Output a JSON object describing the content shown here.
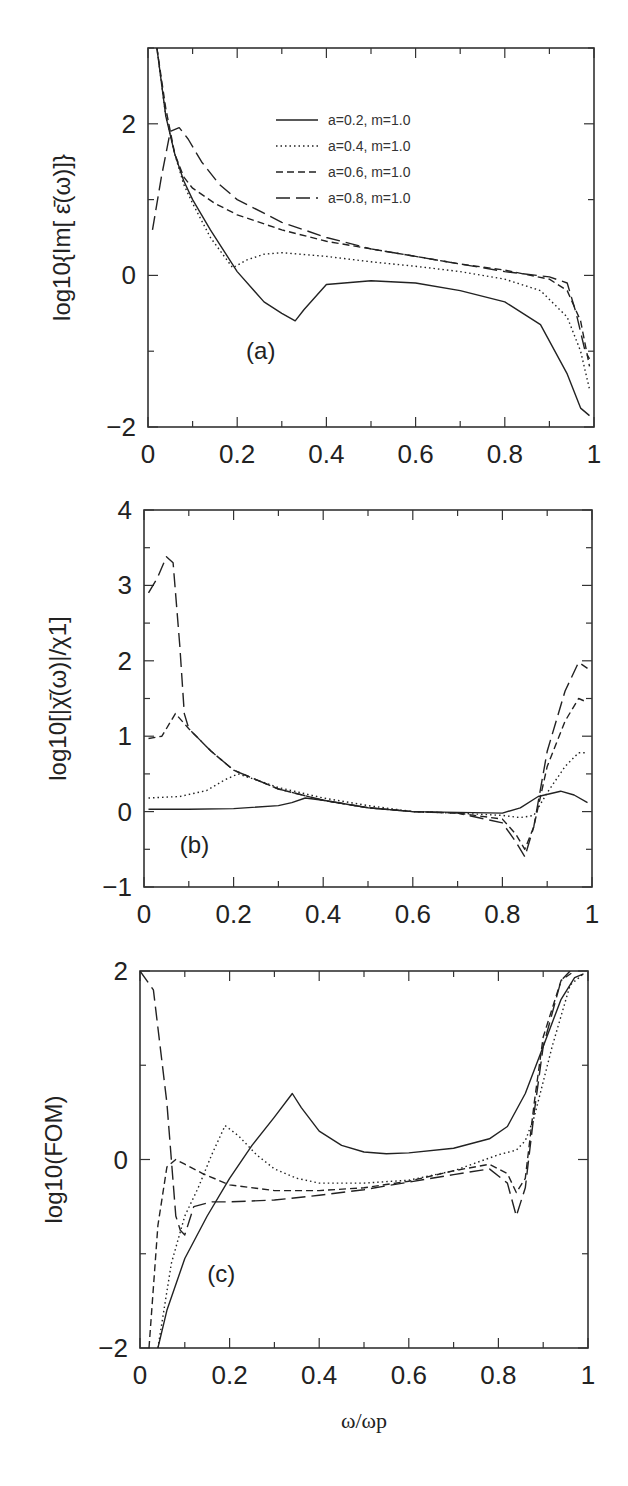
{
  "chart_data": [
    {
      "type": "line",
      "panel": "(a)",
      "ylabel": "log10{Im[ ε̄(ω)]}",
      "xlabel": "",
      "xlim": [
        0,
        1
      ],
      "ylim": [
        -2,
        3
      ],
      "xticks": [
        "0",
        "0.2",
        "0.4",
        "0.6",
        "0.8",
        "1"
      ],
      "yticks": [
        "-2",
        "0",
        "2"
      ],
      "legend_placement": "top-right",
      "series": [
        {
          "name": "a=0.2, m=1.0",
          "style": "solid",
          "x": [
            0.02,
            0.04,
            0.06,
            0.08,
            0.1,
            0.14,
            0.2,
            0.26,
            0.3,
            0.33,
            0.35,
            0.4,
            0.5,
            0.6,
            0.7,
            0.8,
            0.88,
            0.94,
            0.97,
            0.99
          ],
          "y": [
            3.0,
            2.1,
            1.6,
            1.25,
            1.0,
            0.6,
            0.05,
            -0.35,
            -0.5,
            -0.6,
            -0.45,
            -0.12,
            -0.07,
            -0.1,
            -0.2,
            -0.35,
            -0.65,
            -1.3,
            -1.75,
            -1.85
          ]
        },
        {
          "name": "a=0.4, m=1.0",
          "style": "dotted",
          "x": [
            0.02,
            0.04,
            0.06,
            0.08,
            0.1,
            0.14,
            0.19,
            0.22,
            0.26,
            0.3,
            0.4,
            0.5,
            0.6,
            0.7,
            0.8,
            0.88,
            0.94,
            0.97,
            0.99
          ],
          "y": [
            3.0,
            2.1,
            1.6,
            1.2,
            0.95,
            0.5,
            0.1,
            0.2,
            0.28,
            0.3,
            0.25,
            0.18,
            0.12,
            0.05,
            -0.05,
            -0.2,
            -0.55,
            -1.0,
            -1.5
          ]
        },
        {
          "name": "a=0.6, m=1.0",
          "style": "dashed",
          "x": [
            0.02,
            0.04,
            0.06,
            0.08,
            0.1,
            0.15,
            0.2,
            0.3,
            0.4,
            0.5,
            0.6,
            0.7,
            0.8,
            0.9,
            0.94,
            0.97,
            0.99
          ],
          "y": [
            3.0,
            2.2,
            1.6,
            1.3,
            1.15,
            0.95,
            0.8,
            0.6,
            0.45,
            0.35,
            0.25,
            0.15,
            0.07,
            -0.05,
            -0.2,
            -0.6,
            -1.2
          ]
        },
        {
          "name": "a=0.8, m=1.0",
          "style": "long-dashed",
          "x": [
            0.01,
            0.03,
            0.05,
            0.07,
            0.09,
            0.12,
            0.16,
            0.2,
            0.3,
            0.4,
            0.5,
            0.6,
            0.7,
            0.8,
            0.9,
            0.94,
            0.96,
            0.98,
            0.99
          ],
          "y": [
            0.6,
            1.3,
            1.9,
            1.95,
            1.8,
            1.5,
            1.2,
            1.0,
            0.7,
            0.5,
            0.35,
            0.25,
            0.15,
            0.05,
            -0.02,
            -0.1,
            -0.5,
            -1.0,
            -1.1
          ]
        }
      ]
    },
    {
      "type": "line",
      "panel": "(b)",
      "ylabel": "log10[|χ̄(ω)|/χ1]",
      "xlabel": "",
      "xlim": [
        0,
        1
      ],
      "ylim": [
        -1,
        4
      ],
      "xticks": [
        "0",
        "0.2",
        "0.4",
        "0.6",
        "0.8",
        "1"
      ],
      "yticks": [
        "-1",
        "0",
        "1",
        "2",
        "3",
        "4"
      ],
      "series": [
        {
          "name": "a=0.2, m=1.0",
          "style": "solid",
          "x": [
            0.01,
            0.1,
            0.2,
            0.3,
            0.33,
            0.36,
            0.4,
            0.5,
            0.6,
            0.7,
            0.8,
            0.84,
            0.88,
            0.93,
            0.96,
            0.99
          ],
          "y": [
            0.03,
            0.03,
            0.04,
            0.08,
            0.12,
            0.18,
            0.15,
            0.05,
            0.0,
            -0.01,
            -0.02,
            0.05,
            0.2,
            0.27,
            0.22,
            0.12
          ]
        },
        {
          "name": "a=0.4, m=1.0",
          "style": "dotted",
          "x": [
            0.01,
            0.08,
            0.14,
            0.18,
            0.21,
            0.25,
            0.3,
            0.4,
            0.5,
            0.6,
            0.7,
            0.8,
            0.84,
            0.87,
            0.9,
            0.94,
            0.97,
            0.99
          ],
          "y": [
            0.18,
            0.2,
            0.28,
            0.42,
            0.5,
            0.42,
            0.32,
            0.18,
            0.08,
            0.0,
            -0.02,
            -0.05,
            -0.08,
            -0.05,
            0.25,
            0.6,
            0.78,
            0.78
          ]
        },
        {
          "name": "a=0.6, m=1.0",
          "style": "dashed",
          "x": [
            0.01,
            0.04,
            0.07,
            0.1,
            0.15,
            0.2,
            0.3,
            0.4,
            0.5,
            0.6,
            0.7,
            0.8,
            0.83,
            0.85,
            0.87,
            0.9,
            0.94,
            0.97,
            0.99
          ],
          "y": [
            0.97,
            1.0,
            1.3,
            1.1,
            0.8,
            0.55,
            0.3,
            0.15,
            0.05,
            0.0,
            -0.02,
            -0.1,
            -0.3,
            -0.5,
            -0.2,
            0.6,
            1.2,
            1.5,
            1.45
          ]
        },
        {
          "name": "a=0.8, m=1.0",
          "style": "long-dashed",
          "x": [
            0.01,
            0.03,
            0.05,
            0.065,
            0.08,
            0.09,
            0.1,
            0.15,
            0.2,
            0.3,
            0.4,
            0.5,
            0.6,
            0.7,
            0.8,
            0.83,
            0.85,
            0.87,
            0.9,
            0.94,
            0.97,
            0.99
          ],
          "y": [
            2.9,
            3.1,
            3.38,
            3.3,
            2.2,
            1.3,
            1.1,
            0.8,
            0.55,
            0.3,
            0.15,
            0.05,
            0.0,
            -0.02,
            -0.15,
            -0.4,
            -0.6,
            -0.2,
            0.8,
            1.6,
            1.98,
            1.9
          ]
        }
      ]
    },
    {
      "type": "line",
      "panel": "(c)",
      "ylabel": "log10(FOM)",
      "xlabel": "ω/ωp",
      "xlim": [
        0,
        1
      ],
      "ylim": [
        -2,
        2
      ],
      "xticks": [
        "0",
        "0.2",
        "0.4",
        "0.6",
        "0.8",
        "1"
      ],
      "yticks": [
        "-2",
        "0",
        "2"
      ],
      "series": [
        {
          "name": "a=0.2, m=1.0",
          "style": "solid",
          "x": [
            0.04,
            0.06,
            0.1,
            0.15,
            0.2,
            0.25,
            0.3,
            0.34,
            0.36,
            0.4,
            0.45,
            0.5,
            0.55,
            0.6,
            0.7,
            0.78,
            0.82,
            0.86,
            0.9,
            0.94,
            0.97,
            0.99
          ],
          "y": [
            -2.0,
            -1.6,
            -1.05,
            -0.6,
            -0.2,
            0.15,
            0.45,
            0.7,
            0.55,
            0.3,
            0.15,
            0.08,
            0.06,
            0.07,
            0.12,
            0.22,
            0.35,
            0.7,
            1.2,
            1.7,
            1.93,
            1.97
          ]
        },
        {
          "name": "a=0.4, m=1.0",
          "style": "dotted",
          "x": [
            0.04,
            0.07,
            0.1,
            0.13,
            0.16,
            0.19,
            0.22,
            0.26,
            0.3,
            0.35,
            0.4,
            0.5,
            0.6,
            0.7,
            0.8,
            0.84,
            0.86,
            0.88,
            0.92,
            0.96,
            0.99
          ],
          "y": [
            -2.0,
            -1.1,
            -0.6,
            -0.3,
            0.05,
            0.36,
            0.25,
            0.05,
            -0.1,
            -0.2,
            -0.25,
            -0.25,
            -0.22,
            -0.12,
            0.05,
            0.1,
            0.2,
            0.45,
            1.2,
            1.85,
            1.97
          ]
        },
        {
          "name": "a=0.6, m=1.0",
          "style": "dashed",
          "x": [
            0.02,
            0.04,
            0.06,
            0.08,
            0.1,
            0.14,
            0.2,
            0.3,
            0.4,
            0.5,
            0.6,
            0.7,
            0.78,
            0.82,
            0.84,
            0.86,
            0.88,
            0.9,
            0.94,
            0.97
          ],
          "y": [
            -2.0,
            -0.7,
            -0.08,
            0.0,
            -0.05,
            -0.15,
            -0.27,
            -0.33,
            -0.33,
            -0.3,
            -0.23,
            -0.12,
            -0.05,
            -0.15,
            -0.35,
            -0.2,
            0.6,
            1.3,
            1.9,
            2.0
          ]
        },
        {
          "name": "a=0.8, m=1.0",
          "style": "long-dashed",
          "x": [
            0.0,
            0.03,
            0.06,
            0.08,
            0.09,
            0.1,
            0.12,
            0.16,
            0.2,
            0.3,
            0.4,
            0.5,
            0.6,
            0.7,
            0.78,
            0.82,
            0.84,
            0.86,
            0.88,
            0.9,
            0.94,
            0.96
          ],
          "y": [
            2.0,
            1.8,
            0.6,
            -0.6,
            -0.75,
            -0.8,
            -0.5,
            -0.45,
            -0.45,
            -0.43,
            -0.38,
            -0.32,
            -0.24,
            -0.16,
            -0.1,
            -0.25,
            -0.6,
            -0.3,
            0.5,
            1.2,
            1.9,
            2.0
          ]
        }
      ]
    }
  ]
}
